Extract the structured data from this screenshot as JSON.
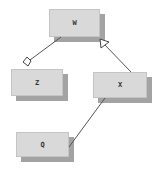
{
  "diagram": {
    "type": "uml-class-diagram",
    "nodes": [
      {
        "id": "W",
        "label": "W"
      },
      {
        "id": "Z",
        "label": "Z"
      },
      {
        "id": "X",
        "label": "X"
      },
      {
        "id": "Q",
        "label": "Q"
      }
    ],
    "edges": [
      {
        "from": "Z",
        "to": "W",
        "kind": "aggregation",
        "marker": "hollow-diamond-at-Z"
      },
      {
        "from": "X",
        "to": "W",
        "kind": "generalization",
        "marker": "hollow-triangle-at-W"
      },
      {
        "from": "Q",
        "to": "X",
        "kind": "association",
        "marker": "none"
      }
    ]
  },
  "colors": {
    "box_fill": "#d9d9d9",
    "box_shadow": "#a3a3a3",
    "line": "#555555",
    "text": "#333333"
  }
}
